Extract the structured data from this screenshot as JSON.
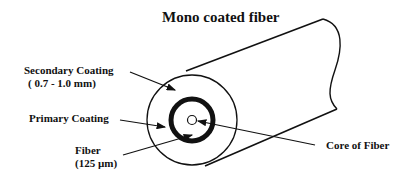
{
  "title": "Mono coated fiber",
  "labels": {
    "secondary_coating": "Secondary Coating",
    "secondary_coating_size": "( 0.7 - 1.0 mm)",
    "primary_coating": "Primary Coating",
    "fiber": "Fiber",
    "fiber_size": "(125 µm)",
    "core": "Core of Fiber"
  },
  "colors": {
    "line": "#111111",
    "background": "#ffffff"
  }
}
